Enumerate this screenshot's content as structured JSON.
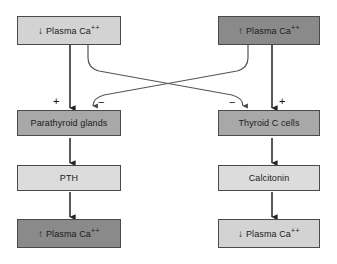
{
  "diagram": {
    "palette": {
      "stroke": "#4a4a4a",
      "arrow": "#222222",
      "curve": "#555555",
      "background": "#ffffff",
      "tone_lightest": "#dcdcdc",
      "tone_light": "#d3d3d3",
      "tone_mid": "#a8a8a8",
      "tone_dark": "#8a8a8a"
    },
    "nodes": [
      {
        "id": "low-plasma-ca-top",
        "arrow_glyph": "↓",
        "text": "Plasma Ca",
        "superscript": "++",
        "tone": "light"
      },
      {
        "id": "high-plasma-ca-top",
        "arrow_glyph": "↑",
        "text": "Plasma Ca",
        "superscript": "++",
        "tone": "dark"
      },
      {
        "id": "parathyroid-glands",
        "arrow_glyph": "",
        "text": "Parathyroid glands",
        "superscript": "",
        "tone": "mid"
      },
      {
        "id": "thyroid-c-cells",
        "arrow_glyph": "",
        "text": "Thyroid C cells",
        "superscript": "",
        "tone": "mid"
      },
      {
        "id": "pth",
        "arrow_glyph": "",
        "text": "PTH",
        "superscript": "",
        "tone": "lightest"
      },
      {
        "id": "calcitonin",
        "arrow_glyph": "",
        "text": "Calcitonin",
        "superscript": "",
        "tone": "lightest"
      },
      {
        "id": "high-plasma-ca-bottom",
        "arrow_glyph": "↑",
        "text": "Plasma Ca",
        "superscript": "++",
        "tone": "dark"
      },
      {
        "id": "low-plasma-ca-bottom",
        "arrow_glyph": "↓",
        "text": "Plasma Ca",
        "superscript": "++",
        "tone": "light"
      }
    ],
    "signs": [
      {
        "id": "stimulate-parathyroid",
        "label": "+"
      },
      {
        "id": "inhibit-parathyroid",
        "label": "−"
      },
      {
        "id": "inhibit-thyroid-c",
        "label": "−"
      },
      {
        "id": "stimulate-thyroid-c",
        "label": "+"
      }
    ]
  }
}
